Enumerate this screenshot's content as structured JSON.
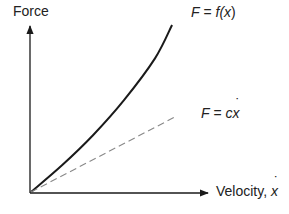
{
  "diagram": {
    "y_axis_label": "Force",
    "x_axis_label_prefix": "Velocity, ",
    "x_axis_symbol": "x",
    "curves": [
      {
        "id": "nonlinear",
        "label_lhs": "F",
        "label_eq": " = ",
        "label_func": "f(",
        "label_var": "x",
        "label_close": ")",
        "style": "solid",
        "color": "#1a1a1a"
      },
      {
        "id": "linear",
        "label_lhs": "F",
        "label_eq": " = ",
        "label_coef": "c",
        "label_var": "x",
        "style": "dashed",
        "color": "#888888"
      }
    ]
  },
  "chart_data": {
    "type": "line",
    "title": "",
    "xlabel": "Velocity, ẋ",
    "ylabel": "Force",
    "xlim": [
      0,
      1
    ],
    "ylim": [
      0,
      1
    ],
    "grid": false,
    "legend": "inline labels at line ends",
    "series": [
      {
        "name": "F = f(ẋ)",
        "style": "solid",
        "x": [
          0,
          0.2,
          0.4,
          0.6,
          0.8,
          0.91
        ],
        "y": [
          0,
          0.16,
          0.34,
          0.55,
          0.8,
          1.0
        ]
      },
      {
        "name": "F = cẋ",
        "style": "dashed",
        "x": [
          0,
          0.93
        ],
        "y": [
          0,
          0.45
        ]
      }
    ]
  }
}
